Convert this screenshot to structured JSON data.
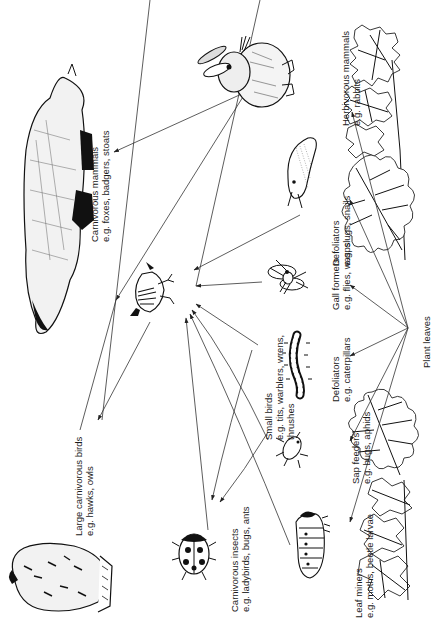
{
  "diagram": {
    "type": "food-web",
    "orientation": "rotated-90-ccw",
    "source_node": {
      "label": "Plant leaves"
    },
    "nodes": {
      "plant_leaves": {
        "title": "Plant leaves"
      },
      "herbivorous_mammals": {
        "title": "Herbivorous mammals",
        "example": "e.g. rabbits"
      },
      "defoliators_slugs": {
        "title": "Defoliators",
        "example": "e.g. slugs, snails"
      },
      "gall_formers": {
        "title": "Gall formers",
        "example": "e.g. flies, wasps"
      },
      "defoliators_caterpillars": {
        "title": "Defoliators",
        "example": "e.g. caterpillars"
      },
      "sap_feeders": {
        "title": "Sap feeders",
        "example": "e.g. bugs, aphids"
      },
      "leaf_miners": {
        "title": "Leaf miners",
        "example": "e.g. moths, beetle larvae"
      },
      "small_birds": {
        "title": "Small birds",
        "example": "e.g. tits, warblers, wrens,",
        "example2": "thrushes"
      },
      "carnivorous_insects": {
        "title": "Carnivorous insects",
        "example": "e.g. ladybirds, bugs, ants"
      },
      "carnivorous_mammals": {
        "title": "Carnivorous mammals",
        "example": "e.g. foxes, badgers, stoats"
      },
      "large_carnivorous_birds": {
        "title": "Large carnivorous birds",
        "example": "e.g. hawks, owls"
      }
    },
    "edges": [
      {
        "from": "Plant leaves",
        "to": "Herbivorous mammals"
      },
      {
        "from": "Plant leaves",
        "to": "Defoliators (slugs, snails)"
      },
      {
        "from": "Plant leaves",
        "to": "Gall formers"
      },
      {
        "from": "Plant leaves",
        "to": "Defoliators (caterpillars)"
      },
      {
        "from": "Plant leaves",
        "to": "Sap feeders"
      },
      {
        "from": "Plant leaves",
        "to": "Leaf miners"
      },
      {
        "from": "Herbivorous mammals",
        "to": "Carnivorous mammals"
      },
      {
        "from": "Herbivorous mammals",
        "to": "Large carnivorous birds"
      },
      {
        "from": "Defoliators (slugs, snails)",
        "to": "Small birds"
      },
      {
        "from": "Gall formers",
        "to": "Small birds"
      },
      {
        "from": "Defoliators (caterpillars)",
        "to": "Small birds"
      },
      {
        "from": "Defoliators (caterpillars)",
        "to": "Carnivorous insects"
      },
      {
        "from": "Sap feeders",
        "to": "Small birds"
      },
      {
        "from": "Sap feeders",
        "to": "Carnivorous insects"
      },
      {
        "from": "Leaf miners",
        "to": "Small birds"
      },
      {
        "from": "Carnivorous insects",
        "to": "Small birds"
      },
      {
        "from": "Small birds",
        "to": "Large carnivorous birds"
      }
    ],
    "illustrations": [
      "oak-leaf",
      "bramble-leaf",
      "rabbit",
      "slug",
      "gall-wasp",
      "caterpillar",
      "aphid",
      "leaf-miner-larva",
      "wren",
      "ladybird",
      "badger",
      "owl"
    ]
  }
}
